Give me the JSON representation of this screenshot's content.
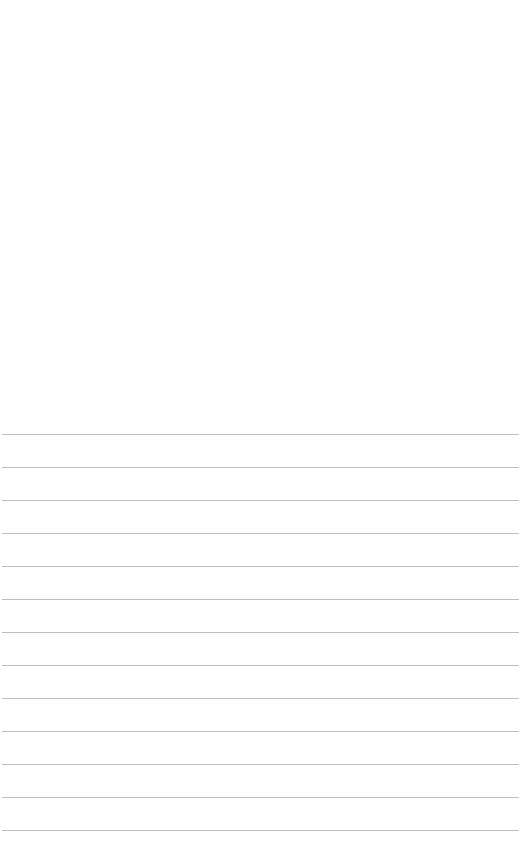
{
  "page": {
    "type": "ruled-notepad-page",
    "background_color": "#ffffff",
    "line_color": "#bdbdbd",
    "line_count": 13,
    "line_positions_y": [
      434,
      467,
      500,
      533,
      566,
      599,
      632,
      665,
      698,
      731,
      764,
      797,
      830
    ],
    "text": ""
  }
}
